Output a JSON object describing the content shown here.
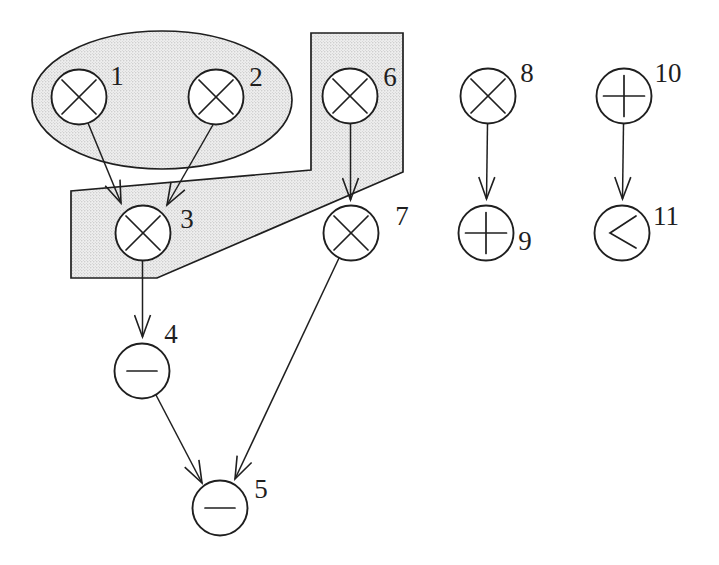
{
  "figure": {
    "canvas": {
      "width": 719,
      "height": 565,
      "background": "#ffffff"
    },
    "style": {
      "stroke_color": "#1f1f1f",
      "node_fill": "#ffffff",
      "node_radius": 27.5,
      "region_fill_base": "#eeeeee",
      "region_dot_color": "#aaaaaa",
      "label_font_size": 27
    },
    "regions": [
      {
        "name": "ellipse-cluster",
        "shape": "ellipse",
        "cx": 162,
        "cy": 100,
        "rx": 130,
        "ry": 69
      },
      {
        "name": "polygon-cluster",
        "shape": "polygon",
        "points": "311,33 403,33 403,172 157,278 71,278 71,191 311,170"
      }
    ],
    "nodes": [
      {
        "id": "1",
        "op": "multiply",
        "symbol": "x",
        "x": 79,
        "y": 97,
        "label": "1",
        "label_x": 117,
        "label_y": 76
      },
      {
        "id": "2",
        "op": "multiply",
        "symbol": "x",
        "x": 216,
        "y": 97,
        "label": "2",
        "label_x": 256,
        "label_y": 77
      },
      {
        "id": "3",
        "op": "multiply",
        "symbol": "x",
        "x": 143,
        "y": 233,
        "label": "3",
        "label_x": 187,
        "label_y": 219
      },
      {
        "id": "4",
        "op": "subtract",
        "symbol": "-",
        "x": 142,
        "y": 371,
        "label": "4",
        "label_x": 171,
        "label_y": 334
      },
      {
        "id": "5",
        "op": "subtract",
        "symbol": "-",
        "x": 220,
        "y": 508,
        "label": "5",
        "label_x": 261,
        "label_y": 489
      },
      {
        "id": "6",
        "op": "multiply",
        "symbol": "x",
        "x": 350,
        "y": 96,
        "label": "6",
        "label_x": 390,
        "label_y": 77
      },
      {
        "id": "7",
        "op": "multiply",
        "symbol": "x",
        "x": 351,
        "y": 233,
        "label": "7",
        "label_x": 402,
        "label_y": 216
      },
      {
        "id": "8",
        "op": "multiply",
        "symbol": "x",
        "x": 488,
        "y": 96,
        "label": "8",
        "label_x": 527,
        "label_y": 73
      },
      {
        "id": "9",
        "op": "add",
        "symbol": "+",
        "x": 486,
        "y": 233,
        "label": "9",
        "label_x": 525,
        "label_y": 241
      },
      {
        "id": "10",
        "op": "add",
        "symbol": "+",
        "x": 624,
        "y": 96,
        "label": "10",
        "label_x": 668,
        "label_y": 73
      },
      {
        "id": "11",
        "op": "less-than",
        "symbol": "<",
        "x": 622,
        "y": 233,
        "label": "11",
        "label_x": 666,
        "label_y": 216
      }
    ],
    "edges": [
      {
        "from": "1",
        "to": "3",
        "x1": 88,
        "y1": 123,
        "x2": 121,
        "y2": 203
      },
      {
        "from": "2",
        "to": "3",
        "x1": 214,
        "y1": 123,
        "x2": 167,
        "y2": 205
      },
      {
        "from": "3",
        "to": "4",
        "x1": 142.5,
        "y1": 261,
        "x2": 142.5,
        "y2": 337
      },
      {
        "from": "4",
        "to": "5",
        "x1": 156,
        "y1": 395,
        "x2": 202,
        "y2": 483
      },
      {
        "from": "6",
        "to": "7",
        "x1": 350.5,
        "y1": 124,
        "x2": 350.5,
        "y2": 200
      },
      {
        "from": "7",
        "to": "5",
        "x1": 339,
        "y1": 258,
        "x2": 235,
        "y2": 479
      },
      {
        "from": "8",
        "to": "9",
        "x1": 487.5,
        "y1": 124,
        "x2": 486.5,
        "y2": 199
      },
      {
        "from": "10",
        "to": "11",
        "x1": 623.5,
        "y1": 124,
        "x2": 622.5,
        "y2": 199
      }
    ]
  }
}
